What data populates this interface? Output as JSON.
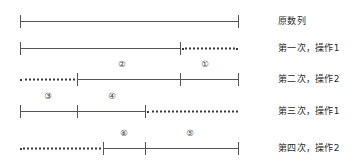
{
  "diagram": {
    "title_caption": "原数列",
    "geometry": {
      "x_left": 20,
      "x_right": 238,
      "caption_x": 278
    },
    "rows": [
      {
        "id": "row-original",
        "caption": "原数列",
        "caption_y": 21,
        "baseline_y": 21,
        "segments": [
          {
            "name": "solid-full",
            "style": "solid",
            "x1": 20,
            "x2": 238
          }
        ],
        "ticks": [
          20,
          238
        ],
        "labels": []
      },
      {
        "id": "row-pass-1",
        "caption": "第一次，操作1",
        "caption_y": 48,
        "baseline_y": 48,
        "segments": [
          {
            "name": "solid-left",
            "style": "solid",
            "x1": 20,
            "x2": 180
          },
          {
            "name": "dotted-right",
            "style": "dotted",
            "x1": 182,
            "x2": 238
          }
        ],
        "ticks": [
          20,
          180
        ],
        "labels": []
      },
      {
        "id": "row-pass-2",
        "caption": "第二次，操作2",
        "caption_y": 79,
        "baseline_y": 79,
        "segments": [
          {
            "name": "dotted-left",
            "style": "dotted",
            "x1": 20,
            "x2": 75
          },
          {
            "name": "solid-right",
            "style": "solid",
            "x1": 77,
            "x2": 238
          }
        ],
        "ticks": [
          77,
          180,
          238
        ],
        "labels": [
          {
            "text": "②",
            "x": 122,
            "y": 70
          },
          {
            "text": "①",
            "x": 205,
            "y": 70
          }
        ]
      },
      {
        "id": "row-pass-3",
        "caption": "第三次，操作1",
        "caption_y": 111,
        "baseline_y": 111,
        "segments": [
          {
            "name": "solid-left",
            "style": "solid",
            "x1": 20,
            "x2": 145
          },
          {
            "name": "dotted-right",
            "style": "dotted",
            "x1": 147,
            "x2": 238
          }
        ],
        "ticks": [
          20,
          77,
          145
        ],
        "labels": [
          {
            "text": "③",
            "x": 48,
            "y": 102
          },
          {
            "text": "④",
            "x": 112,
            "y": 102
          }
        ]
      },
      {
        "id": "row-pass-4",
        "caption": "第四次，操作2",
        "caption_y": 148,
        "baseline_y": 148,
        "segments": [
          {
            "name": "dotted-left",
            "style": "dotted",
            "x1": 20,
            "x2": 101
          },
          {
            "name": "solid-right",
            "style": "solid",
            "x1": 103,
            "x2": 238
          }
        ],
        "ticks": [
          103,
          145,
          238
        ],
        "labels": [
          {
            "text": "⑥",
            "x": 124,
            "y": 139
          },
          {
            "text": "⑤",
            "x": 190,
            "y": 139
          }
        ]
      }
    ]
  },
  "colors": {
    "line": "#555555",
    "dotted": "#3a3a3a",
    "text": "#2b2b2b",
    "background": "#ffffff"
  }
}
